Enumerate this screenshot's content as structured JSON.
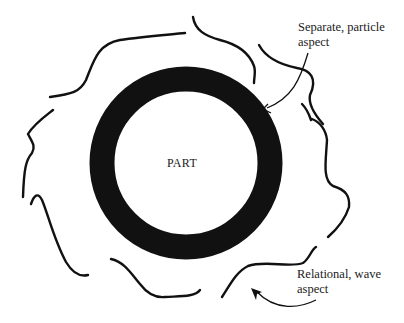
{
  "diagram": {
    "center": {
      "label": "PART"
    },
    "annotations": [
      {
        "id": "particle",
        "line1": "Separate, particle",
        "line2": "aspect"
      },
      {
        "id": "wave",
        "line1": "Relational, wave",
        "line2": "aspect"
      }
    ],
    "colors": {
      "ink": "#111111",
      "background": "#ffffff"
    }
  }
}
